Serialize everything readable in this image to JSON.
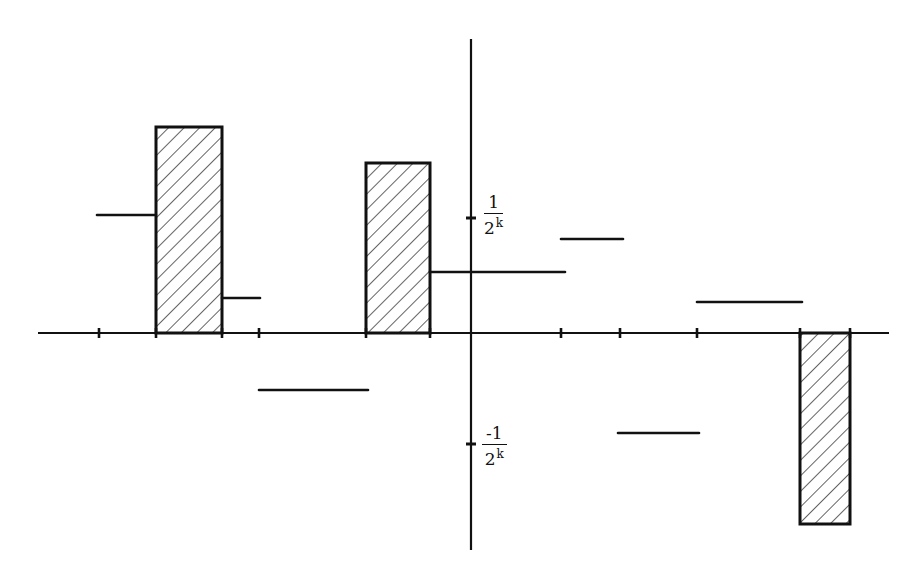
{
  "diagram": {
    "type": "step-function-plot",
    "colors": {
      "ink": "#111111",
      "background": "#ffffff"
    },
    "axes": {
      "origin_px": [
        471,
        333
      ],
      "x_axis": {
        "from_px": 38,
        "to_px": 889
      },
      "y_axis": {
        "from_px": 39,
        "to_px": 550
      },
      "x_ticks_px": [
        99,
        156,
        222,
        259,
        366,
        430,
        561,
        620,
        697,
        800,
        850
      ],
      "y_ticks": [
        {
          "value": "1/2^k",
          "y_px": 218,
          "numerator": "1",
          "base": "2",
          "exponent": "k"
        },
        {
          "value": "-1/2^k",
          "y_px": 444,
          "numerator": "-1",
          "base": "2",
          "exponent": "k"
        }
      ]
    },
    "segments": [
      {
        "x1": 97,
        "x2": 156,
        "y": 215
      },
      {
        "x1": 222,
        "x2": 260,
        "y": 298
      },
      {
        "x1": 259,
        "x2": 368,
        "y": 390
      },
      {
        "x1": 430,
        "x2": 565,
        "y": 272
      },
      {
        "x1": 561,
        "x2": 623,
        "y": 239
      },
      {
        "x1": 618,
        "x2": 699,
        "y": 433
      },
      {
        "x1": 697,
        "x2": 802,
        "y": 302
      }
    ],
    "hatched_bars": [
      {
        "x1": 156,
        "x2": 222,
        "y_top": 127,
        "y_bottom": 333
      },
      {
        "x1": 366,
        "x2": 430,
        "y_top": 163,
        "y_bottom": 333
      },
      {
        "x1": 800,
        "x2": 850,
        "y_top": 333,
        "y_bottom": 524
      }
    ]
  },
  "labels": {
    "pos_tick": {
      "numerator": "1",
      "base": "2",
      "exponent": "k"
    },
    "neg_tick": {
      "numerator": "-1",
      "base": "2",
      "exponent": "k"
    }
  }
}
